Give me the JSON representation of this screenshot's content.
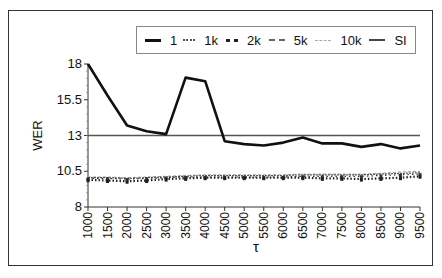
{
  "chart_data": {
    "type": "line",
    "title": "",
    "xlabel": "τ",
    "ylabel": "WER",
    "ylim": [
      8,
      18
    ],
    "yticks": [
      8,
      10.5,
      13,
      15.5,
      18
    ],
    "ytick_labels": [
      "8",
      "10.5",
      "13",
      "15.5",
      "18"
    ],
    "x": [
      1000,
      1500,
      2000,
      2500,
      3000,
      3500,
      4000,
      4500,
      5000,
      5500,
      6000,
      6500,
      7000,
      7500,
      8000,
      8500,
      9000,
      9500
    ],
    "xtick_labels": [
      "1000",
      "1500",
      "2000",
      "2500",
      "3000",
      "3500",
      "4000",
      "4500",
      "5000",
      "5500",
      "6000",
      "6500",
      "7000",
      "7500",
      "8000",
      "8500",
      "9000",
      "9500"
    ],
    "grid": false,
    "legend_position": "top-right, inside frame, horizontal",
    "series": [
      {
        "name": "1",
        "style": "solid-thick",
        "color": "#111111",
        "values": [
          18.0,
          15.8,
          13.7,
          13.3,
          13.1,
          17.05,
          16.8,
          12.6,
          12.4,
          12.3,
          12.5,
          12.85,
          12.45,
          12.45,
          12.2,
          12.4,
          12.1,
          12.3
        ]
      },
      {
        "name": "1k",
        "style": "dotted-sparse",
        "color": "#333333",
        "values": [
          10.0,
          10.0,
          9.95,
          10.0,
          10.05,
          10.1,
          10.1,
          10.1,
          10.1,
          10.1,
          10.1,
          10.15,
          10.15,
          10.15,
          10.15,
          10.2,
          10.25,
          10.3
        ]
      },
      {
        "name": "2k",
        "style": "dotted-dense",
        "color": "#222222",
        "values": [
          9.9,
          9.85,
          9.8,
          9.85,
          9.95,
          10.0,
          10.05,
          10.05,
          10.05,
          10.05,
          10.05,
          10.05,
          10.0,
          10.0,
          9.95,
          10.0,
          10.05,
          10.15
        ]
      },
      {
        "name": "5k",
        "style": "dashed-fine",
        "color": "#555555",
        "values": [
          10.05,
          10.05,
          10.0,
          10.05,
          10.1,
          10.15,
          10.2,
          10.2,
          10.2,
          10.2,
          10.2,
          10.25,
          10.25,
          10.25,
          10.25,
          10.3,
          10.35,
          10.4
        ]
      },
      {
        "name": "10k",
        "style": "dashed-light",
        "color": "#999999",
        "values": [
          10.1,
          10.1,
          10.05,
          10.1,
          10.15,
          10.2,
          10.25,
          10.25,
          10.25,
          10.25,
          10.25,
          10.3,
          10.3,
          10.3,
          10.3,
          10.35,
          10.45,
          10.5
        ]
      },
      {
        "name": "SI",
        "style": "solid-medium",
        "color": "#555555",
        "values": [
          13.0,
          13.0,
          13.0,
          13.0,
          13.0,
          13.0,
          13.0,
          13.0,
          13.0,
          13.0,
          13.0,
          13.0,
          13.0,
          13.0,
          13.0,
          13.0,
          13.0,
          13.0
        ]
      }
    ]
  },
  "legend": {
    "items": [
      {
        "label": "1",
        "style": "solid-thick"
      },
      {
        "label": "1k",
        "style": "dotted-sparse"
      },
      {
        "label": "2k",
        "style": "dotted-dense"
      },
      {
        "label": "5k",
        "style": "dashed-fine"
      },
      {
        "label": "10k",
        "style": "dashed-light"
      },
      {
        "label": "SI",
        "style": "solid-medium"
      }
    ]
  },
  "axes": {
    "ylabel": "WER",
    "xlabel": "τ"
  }
}
